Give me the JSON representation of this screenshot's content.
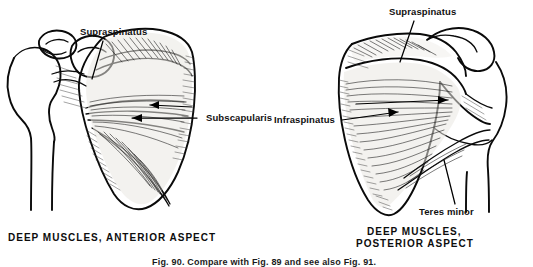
{
  "figure": {
    "bottom_caption": "Fig. 90. Compare with Fig. 89 and see also Fig. 91.",
    "bottom_caption_clipped": true
  },
  "panels": [
    {
      "id": "anterior",
      "caption_lines": [
        "DEEP MUSCLES, ANTERIOR ASPECT"
      ],
      "labels": [
        {
          "name": "supraspinatus",
          "text": "Supraspinatus"
        },
        {
          "name": "subscapularis",
          "text": "Subscapularis"
        }
      ]
    },
    {
      "id": "posterior",
      "caption_lines": [
        "DEEP MUSCLES,",
        "POSTERIOR ASPECT"
      ],
      "labels": [
        {
          "name": "supraspinatus",
          "text": "Supraspinatus"
        },
        {
          "name": "infraspinatus",
          "text": "Infraspinatus"
        },
        {
          "name": "teres-minor",
          "text": "Teres  minor"
        }
      ]
    }
  ],
  "colors": {
    "ink": "#0a0a0a",
    "muscle_fill": "#e9e7e2",
    "background": "#ffffff"
  }
}
